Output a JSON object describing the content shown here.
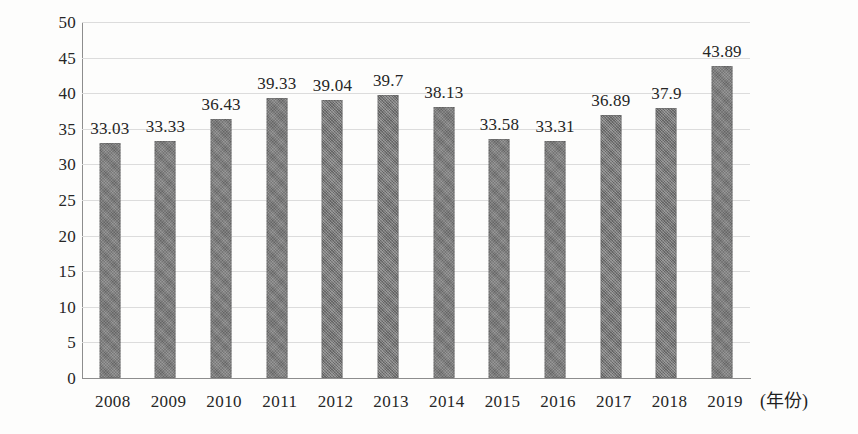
{
  "chart_data": {
    "type": "bar",
    "title": "",
    "subtitle": "",
    "xlabel": "(年份)",
    "ylabel": "",
    "categories": [
      "2008",
      "2009",
      "2010",
      "2011",
      "2012",
      "2013",
      "2014",
      "2015",
      "2016",
      "2017",
      "2018",
      "2019"
    ],
    "values": [
      33.03,
      33.33,
      36.43,
      39.33,
      39.04,
      39.7,
      38.13,
      33.58,
      33.31,
      36.89,
      37.9,
      43.89
    ],
    "value_labels": [
      "33.03",
      "33.33",
      "36.43",
      "39.33",
      "39.04",
      "39.7",
      "38.13",
      "33.58",
      "33.31",
      "36.89",
      "37.9",
      "43.89"
    ],
    "ylim": [
      0,
      50
    ],
    "ytick_values": [
      0,
      5,
      10,
      15,
      20,
      25,
      30,
      35,
      40,
      45,
      50
    ],
    "ytick_labels": [
      "0",
      "5",
      "10",
      "15",
      "20",
      "25",
      "30",
      "35",
      "40",
      "45",
      "50"
    ],
    "grid": true,
    "grid_axis": "y",
    "legend": false,
    "legend_position": "none",
    "bar_color": "#767676",
    "grid_color": "#dcdcdc",
    "axis_color": "#8d8d8d",
    "text_color": "#262626",
    "background_color": "#fdfdfc",
    "data_labels_shown": true
  }
}
